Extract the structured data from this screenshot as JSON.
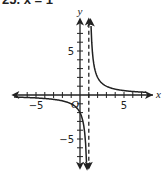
{
  "problem": {
    "label": "25. x = 1"
  },
  "chart_data": {
    "type": "line",
    "title": "",
    "function": "y = 2/(x - 1)",
    "xlabel": "x",
    "ylabel": "y",
    "origin_label": "O",
    "xlim": [
      -7.8,
      8.3
    ],
    "ylim": [
      -8.5,
      8.8
    ],
    "tick_step": 1,
    "x_tick_labels": [
      {
        "value": -5,
        "text": "−5"
      },
      {
        "value": 5,
        "text": "5"
      }
    ],
    "y_tick_labels": [
      {
        "value": 5,
        "text": "5"
      },
      {
        "value": -5,
        "text": "−5"
      }
    ],
    "grid": false,
    "asymptotes": [
      {
        "type": "vertical",
        "x": 1,
        "style": "dashed"
      },
      {
        "type": "horizontal",
        "y": 0
      }
    ],
    "series": [
      {
        "name": "left branch",
        "x": [
          -7.5,
          -5,
          -3,
          -2,
          -1,
          0,
          0.5,
          0.72
        ],
        "y": [
          -0.24,
          -0.33,
          -0.5,
          -0.67,
          -1,
          -2,
          -4,
          -7.2
        ]
      },
      {
        "name": "right branch",
        "x": [
          1.25,
          1.5,
          2,
          3,
          4,
          5,
          6,
          7.5
        ],
        "y": [
          8,
          4,
          2,
          1,
          0.67,
          0.5,
          0.4,
          0.31
        ]
      }
    ],
    "colors": {
      "curve": "#222222",
      "axis": "#222222",
      "asymptote": "#222222"
    }
  }
}
